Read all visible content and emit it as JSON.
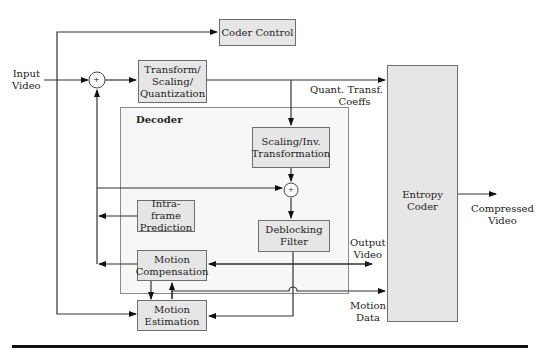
{
  "diagram": {
    "inputs": {
      "input_video": "Input\nVideo"
    },
    "blocks": {
      "coder_control": "Coder Control",
      "transform": [
        "Transform/",
        "Scaling/",
        "Quantization"
      ],
      "decoder_group": "Decoder",
      "scaling_inv": [
        "Scaling/Inv.",
        "Transformation"
      ],
      "intra_pred": [
        "Intra-frame",
        "Prediction"
      ],
      "deblocking": [
        "Deblocking",
        "Filter"
      ],
      "motion_comp": [
        "Motion",
        "Compensation"
      ],
      "motion_est": [
        "Motion",
        "Estimation"
      ],
      "entropy": "Entropy Coder"
    },
    "edge_labels": {
      "quant_coeffs": [
        "Quant. Transf.",
        "Coeffs"
      ],
      "output_video": [
        "Output",
        "Video"
      ],
      "motion_data": [
        "Motion",
        "Data"
      ],
      "compressed_video": [
        "Compressed",
        "Video"
      ],
      "input_video": [
        "Input",
        "Video"
      ]
    },
    "summing_symbol": "+",
    "colors": {
      "block_fill": "#e6e6e6",
      "decoder_fill": "#f7f7f7",
      "line": "#222222"
    }
  }
}
